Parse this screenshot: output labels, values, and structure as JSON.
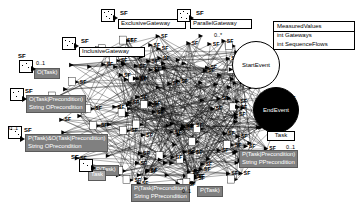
{
  "diagram": {
    "background": "#ffffff",
    "edge_color": "#000000",
    "label_fill": "#808080",
    "label_text": "#ffffff",
    "node_fill": "#ffffff",
    "node_stroke": "#000000"
  },
  "measured_values": {
    "class_name": "MeasuredValues",
    "attributes": [
      "int  Gateways",
      "int  SequenceFlows"
    ]
  },
  "events": {
    "start": {
      "label": "StartEvent",
      "shape": "circle",
      "fill": "#ffffff"
    },
    "end": {
      "label": "EndEvent",
      "shape": "circle",
      "fill": "#000000"
    }
  },
  "task_box": {
    "label": "Task"
  },
  "associations": [
    {
      "id": "exclusive-gateway",
      "role": "SF",
      "line1": "ExclusiveGateway",
      "line2": "",
      "multiplicity": "",
      "style": "white"
    },
    {
      "id": "parallel-gateway",
      "role": "SF",
      "line1": "ParallelGateway",
      "line2": "",
      "multiplicity": "",
      "style": "white"
    },
    {
      "id": "inclusive-gateway",
      "role": "SF",
      "line1": "InclusiveGateway",
      "line2": "",
      "multiplicity": "",
      "style": "white"
    },
    {
      "id": "o-task",
      "role": "SF",
      "line1": "O(Task)",
      "line2": "",
      "multiplicity": "0..1",
      "style": "grey"
    },
    {
      "id": "o-task-precondition",
      "role": "SF",
      "line1": "O(Task|Precondition)",
      "line2": "String  OPrecondition",
      "multiplicity": "0..1",
      "style": "grey"
    },
    {
      "id": "p-task-and-o-task-precondition",
      "role": "SF",
      "line1": "P(Task)&O(Task|Precondition)",
      "line2": "String  OPrecondition",
      "multiplicity": "0..1",
      "style": "grey"
    },
    {
      "id": "p-task",
      "role": "SF",
      "line1": "P(Task)",
      "line2": "",
      "multiplicity": "0..1",
      "style": "grey"
    },
    {
      "id": "p-task-precondition-bottom",
      "role": "SF",
      "line1": "P(Task|Precondition)",
      "line2": "String  PPrecondition",
      "multiplicity": "0..1",
      "style": "grey"
    },
    {
      "id": "p-task-precondition-right",
      "role": "SF",
      "line1": "P(Task|Precondition)",
      "line2": "String  PPrecondition",
      "multiplicity": "0..1",
      "style": "grey"
    },
    {
      "id": "task-right",
      "role": "SF",
      "line1": "Task",
      "line2": "",
      "multiplicity": "0..1",
      "style": "white"
    }
  ],
  "sequence_flow_tag": "SF",
  "start_multiplicity": "0..*"
}
